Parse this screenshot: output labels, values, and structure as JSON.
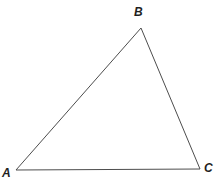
{
  "diagram": {
    "type": "triangle",
    "background": "#ffffff",
    "stroke_color": "#4d4d4d",
    "stroke_width": "1",
    "points": "16,170 141,28 200,169",
    "vertices": {
      "a": {
        "label": "A",
        "x": 16,
        "y": 170,
        "position": "bottom-left"
      },
      "b": {
        "label": "B",
        "x": 141,
        "y": 28,
        "position": "top"
      },
      "c": {
        "label": "C",
        "x": 200,
        "y": 169,
        "position": "bottom-right"
      }
    }
  }
}
